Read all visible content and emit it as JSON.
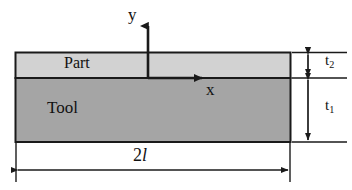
{
  "diagram": {
    "type": "engineering-cross-section",
    "layers": [
      {
        "name": "part",
        "label": "Part",
        "fill_color": "#d2d2d2",
        "thickness_label": "t",
        "thickness_subscript": "2"
      },
      {
        "name": "tool",
        "label": "Tool",
        "fill_color": "#a5a5a5",
        "thickness_label": "t",
        "thickness_subscript": "1"
      }
    ],
    "axes": {
      "y_label": "y",
      "x_label": "x",
      "origin_note": "origin at part-tool interface, mid-span"
    },
    "dimensions": [
      {
        "name": "width",
        "prefix": "2",
        "symbol": "l",
        "italic_symbol": true,
        "placement": "below"
      },
      {
        "name": "part-thickness",
        "symbol": "t",
        "subscript": "2",
        "placement": "right"
      },
      {
        "name": "tool-thickness",
        "symbol": "t",
        "subscript": "1",
        "placement": "right"
      }
    ],
    "colors": {
      "part_fill": "#d2d2d2",
      "tool_fill": "#a5a5a5",
      "outline": "#1a1a1a",
      "dimension_line": "#1a1a1a",
      "background": "#ffffff"
    }
  }
}
